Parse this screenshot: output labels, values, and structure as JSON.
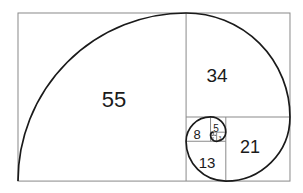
{
  "diagram": {
    "colors": {
      "square_stroke": "#8a8a8a",
      "spiral_stroke": "#1a1a1a",
      "background": "#ffffff"
    },
    "squares": [
      {
        "label": "55",
        "value": 55
      },
      {
        "label": "34",
        "value": 34
      },
      {
        "label": "21",
        "value": 21
      },
      {
        "label": "13",
        "value": 13
      },
      {
        "label": "8",
        "value": 8
      },
      {
        "label": "5",
        "value": 5
      },
      {
        "label": "3",
        "value": 3
      },
      {
        "label": "2",
        "value": 2
      },
      {
        "label": "1",
        "value": 1
      },
      {
        "label": "1",
        "value": 1
      }
    ]
  }
}
